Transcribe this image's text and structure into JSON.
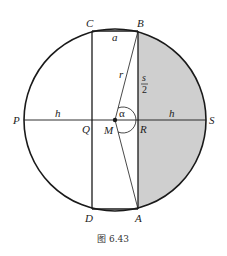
{
  "figure": {
    "caption": "图 6.43",
    "colors": {
      "stroke": "#1a1a1a",
      "shade": "#cfcfcf",
      "background": "#ffffff"
    },
    "points": {
      "A": "A",
      "B": "B",
      "C": "C",
      "D": "D",
      "P": "P",
      "Q": "Q",
      "M": "M",
      "R": "R",
      "S": "S"
    },
    "labels": {
      "a": "a",
      "r": "r",
      "s_num": "s",
      "s_den": "2",
      "h_left": "h",
      "h_right": "h",
      "alpha": "α"
    }
  }
}
